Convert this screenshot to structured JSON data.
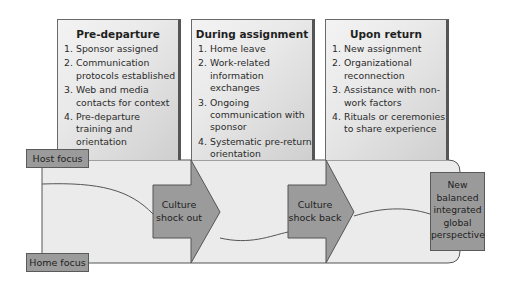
{
  "phases": [
    {
      "title": "Pre-departure",
      "items": [
        {
          "n": "1.",
          "text": "Sponsor assigned"
        },
        {
          "n": "2.",
          "text": "Communication protocols established"
        },
        {
          "n": "3.",
          "text": "Web and media contacts for context"
        },
        {
          "n": "4.",
          "text": "Pre-departure training and orientation"
        }
      ]
    },
    {
      "title": "During assignment",
      "items": [
        {
          "n": "1.",
          "text": "Home leave"
        },
        {
          "n": "2.",
          "text": "Work-related information exchanges"
        },
        {
          "n": "3.",
          "text": "Ongoing communication with sponsor"
        },
        {
          "n": "4.",
          "text": "Systematic pre-return orientation"
        }
      ]
    },
    {
      "title": "Upon return",
      "items": [
        {
          "n": "1.",
          "text": "New assignment"
        },
        {
          "n": "2.",
          "text": "Organizational reconnection"
        },
        {
          "n": "3.",
          "text": "Assistance with non-work factors"
        },
        {
          "n": "4.",
          "text": "Rituals or ceremonies to share experience"
        }
      ]
    }
  ],
  "axis_labels": {
    "top": "Host focus",
    "bottom": "Home focus"
  },
  "arrows": [
    {
      "label_line1": "Culture",
      "label_line2": "shock out"
    },
    {
      "label_line1": "Culture",
      "label_line2": "shock back"
    }
  ],
  "outcome": {
    "lines": [
      "New",
      "balanced",
      "integrated",
      "global",
      "perspective"
    ]
  },
  "colors": {
    "band": "#ebebeb",
    "arrow": "#9b9b9b",
    "outline": "#555555"
  }
}
